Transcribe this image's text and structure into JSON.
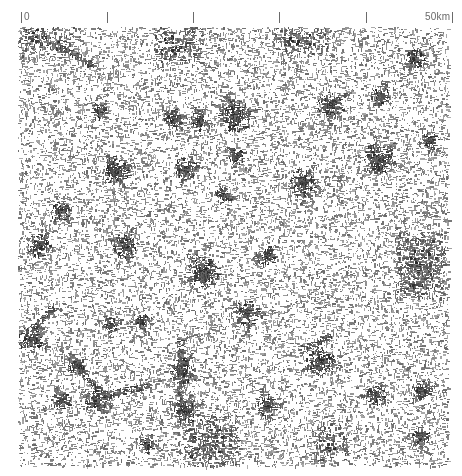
{
  "figure": {
    "type": "settlement figure-ground map",
    "background_color": "#ffffff",
    "ink_color": "#2a2a2a"
  },
  "scale_bar": {
    "start_label": "0",
    "end_label": "50km",
    "unit": "km",
    "total_length_km": 50,
    "interval_km": 10,
    "tick_x": [
      21,
      107,
      193,
      279,
      366,
      452
    ],
    "tick_color": "#6a6a6a"
  },
  "map": {
    "extent_px": {
      "left": 18,
      "top": 27,
      "right": 448,
      "bottom": 466
    },
    "dense_urban_areas": [
      {
        "name": "large-city-east",
        "x": 420,
        "y": 265,
        "w": 34,
        "h": 50,
        "density": 0.9
      },
      {
        "name": "north-edge-cluster-center",
        "x": 178,
        "y": 42,
        "w": 34,
        "h": 28,
        "density": 0.75
      },
      {
        "name": "north-edge-cluster-left",
        "x": 45,
        "y": 38,
        "w": 40,
        "h": 18,
        "density": 0.7
      },
      {
        "name": "north-edge-cluster-right",
        "x": 300,
        "y": 38,
        "w": 40,
        "h": 16,
        "density": 0.6
      },
      {
        "name": "south-city-center",
        "x": 210,
        "y": 440,
        "w": 40,
        "h": 36,
        "density": 0.75
      },
      {
        "name": "south-city-right",
        "x": 330,
        "y": 440,
        "w": 20,
        "h": 26,
        "density": 0.65
      }
    ],
    "towns": [
      {
        "x": 234,
        "y": 115,
        "r": 10
      },
      {
        "x": 198,
        "y": 120,
        "r": 6
      },
      {
        "x": 172,
        "y": 118,
        "r": 6
      },
      {
        "x": 236,
        "y": 155,
        "r": 5
      },
      {
        "x": 185,
        "y": 168,
        "r": 7
      },
      {
        "x": 222,
        "y": 195,
        "r": 5
      },
      {
        "x": 302,
        "y": 182,
        "r": 9
      },
      {
        "x": 378,
        "y": 158,
        "r": 10
      },
      {
        "x": 330,
        "y": 104,
        "r": 8
      },
      {
        "x": 380,
        "y": 95,
        "r": 6
      },
      {
        "x": 415,
        "y": 58,
        "r": 6
      },
      {
        "x": 115,
        "y": 170,
        "r": 9
      },
      {
        "x": 97,
        "y": 110,
        "r": 5
      },
      {
        "x": 60,
        "y": 210,
        "r": 6
      },
      {
        "x": 38,
        "y": 245,
        "r": 7
      },
      {
        "x": 125,
        "y": 245,
        "r": 8
      },
      {
        "x": 202,
        "y": 272,
        "r": 10
      },
      {
        "x": 266,
        "y": 255,
        "r": 6
      },
      {
        "x": 246,
        "y": 312,
        "r": 8
      },
      {
        "x": 320,
        "y": 360,
        "r": 9
      },
      {
        "x": 30,
        "y": 338,
        "r": 8
      },
      {
        "x": 110,
        "y": 325,
        "r": 5
      },
      {
        "x": 75,
        "y": 365,
        "r": 6
      },
      {
        "x": 140,
        "y": 320,
        "r": 5
      },
      {
        "x": 180,
        "y": 370,
        "r": 8
      },
      {
        "x": 95,
        "y": 400,
        "r": 7
      },
      {
        "x": 185,
        "y": 410,
        "r": 8
      },
      {
        "x": 265,
        "y": 405,
        "r": 7
      },
      {
        "x": 375,
        "y": 395,
        "r": 6
      },
      {
        "x": 420,
        "y": 390,
        "r": 6
      },
      {
        "x": 430,
        "y": 140,
        "r": 5
      },
      {
        "x": 60,
        "y": 400,
        "r": 6
      },
      {
        "x": 145,
        "y": 445,
        "r": 5
      },
      {
        "x": 420,
        "y": 435,
        "r": 6
      }
    ],
    "corridors": [
      {
        "from": [
          30,
          330
        ],
        "to": [
          55,
          305
        ]
      },
      {
        "from": [
          75,
          365
        ],
        "to": [
          100,
          390
        ]
      },
      {
        "from": [
          100,
          395
        ],
        "to": [
          150,
          385
        ]
      },
      {
        "from": [
          180,
          340
        ],
        "to": [
          180,
          410
        ]
      },
      {
        "from": [
          55,
          45
        ],
        "to": [
          95,
          65
        ]
      },
      {
        "from": [
          330,
          335
        ],
        "to": [
          300,
          350
        ]
      }
    ],
    "seed": 20240517
  }
}
